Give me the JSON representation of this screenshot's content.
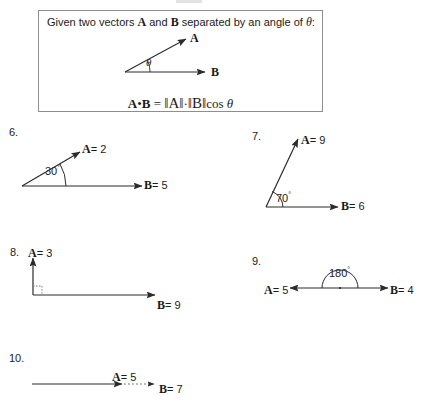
{
  "page": {
    "background_color": "#ffffff",
    "ink_color": "#1d1d1d",
    "width": 432,
    "height": 401
  },
  "definition": {
    "intro_prefix": "Given two vectors",
    "vector_a": "A",
    "intro_middle": "and",
    "vector_b": "B",
    "intro_suffix": "separated by an angle of",
    "theta_symbol": "θ",
    "colon": ":",
    "formula": "A • B = ‖A‖ · ‖B‖ cos θ",
    "formula_parts": {
      "a": "A",
      "dot": "•",
      "b": "B",
      "equals": "=",
      "norm_a": "‖A‖",
      "middot": "·",
      "norm_b": "‖B‖",
      "cos": "cos",
      "theta": "θ"
    },
    "diagram": {
      "label_a": "A",
      "label_b": "B",
      "angle_symbol": "θ"
    }
  },
  "problems": [
    {
      "number": "6.",
      "vector_a_label": "A",
      "vector_a_value": "= 2",
      "vector_b_label": "B",
      "vector_b_value": "= 5",
      "angle": "30",
      "angle_unit": "°",
      "angle_display": "30°",
      "a_style": "solid-arrow",
      "b_style": "solid-arrow"
    },
    {
      "number": "7.",
      "vector_a_label": "A",
      "vector_a_value": "= 9",
      "vector_b_label": "B",
      "vector_b_value": "= 6",
      "angle": "70",
      "angle_unit": "°",
      "angle_display": "70°",
      "a_style": "solid-arrow",
      "b_style": "solid-arrow"
    },
    {
      "number": "8.",
      "vector_a_label": "A",
      "vector_a_value": "= 3",
      "vector_b_label": "B",
      "vector_b_value": "= 9",
      "angle": "90",
      "angle_unit": "°",
      "angle_display": "right angle marker",
      "a_style": "solid-arrow-up",
      "b_style": "solid-arrow"
    },
    {
      "number": "9.",
      "vector_a_label": "A",
      "vector_a_value": "= 5",
      "vector_b_label": "B",
      "vector_b_value": "= 4",
      "angle": "180",
      "angle_unit": "°",
      "angle_display": "180°",
      "a_style": "solid-arrow-left",
      "b_style": "solid-arrow"
    },
    {
      "number": "10.",
      "vector_a_label": "A",
      "vector_a_value": "= 5",
      "vector_b_label": "B",
      "vector_b_value": "= 7",
      "angle": "0",
      "angle_unit": "°",
      "angle_display": "",
      "a_style": "solid-arrow",
      "b_style": "dotted-arrow"
    }
  ]
}
